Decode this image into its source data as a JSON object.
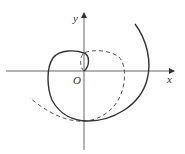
{
  "diagram": {
    "type": "polar-spiral-plot",
    "axes": {
      "x_label": "x",
      "y_label": "y",
      "origin_label": "O"
    },
    "curves": [
      {
        "name": "spiral-solid",
        "style": "solid",
        "color": "#333333"
      },
      {
        "name": "spiral-dashed",
        "style": "dashed",
        "color": "#555555"
      }
    ]
  }
}
